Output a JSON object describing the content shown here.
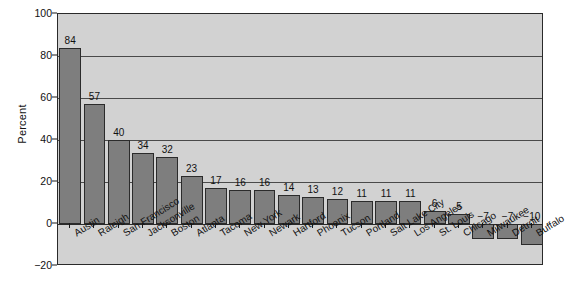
{
  "chart_data": {
    "type": "bar",
    "title": "",
    "xlabel": "",
    "ylabel": "Percent",
    "ylim": [
      -20,
      100
    ],
    "yticks": [
      -20,
      0,
      20,
      40,
      60,
      80,
      100
    ],
    "grid": true,
    "legend": "none",
    "categories": [
      "Austin",
      "Raleigh",
      "San Francisco",
      "Jacksonville",
      "Boston",
      "Atlanta",
      "Tacoma",
      "New York",
      "Newark",
      "Hartford",
      "Phoenix",
      "Tucson",
      "Portland",
      "Salt Lake City",
      "Los Angeles",
      "St. Louis",
      "Chicago",
      "Milwaukee",
      "Detroit",
      "Buffalo"
    ],
    "values": [
      84,
      57,
      40,
      34,
      32,
      23,
      17,
      16,
      16,
      14,
      13,
      12,
      11,
      11,
      11,
      6,
      5,
      -7,
      -7,
      -10
    ],
    "value_labels": [
      "84",
      "57",
      "40",
      "34",
      "32",
      "23",
      "17",
      "16",
      "16",
      "14",
      "13",
      "12",
      "11",
      "11",
      "11",
      "6",
      "5",
      "−7",
      "−7",
      "−10"
    ],
    "ytick_labels": [
      "−20",
      "0",
      "20",
      "40",
      "60",
      "80",
      "100"
    ],
    "colors": {
      "bar_fill": "#7e7e7e",
      "bar_border": "#2b2b2b",
      "plot_background": "#d2d2d2",
      "gridline": "#4a4a4a",
      "axis": "#2a2a2a",
      "text": "#111111",
      "page_background": "#ffffff"
    }
  }
}
